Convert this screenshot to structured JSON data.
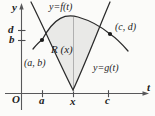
{
  "figure": {
    "background_color": "#fbfbf9",
    "ink_color": "#1d1d1d",
    "shade_color": "#e8e8e8"
  },
  "axes": {
    "y_axis_label": "y",
    "x_axis_label": "t",
    "origin_label": "O",
    "y_ticks": [
      {
        "label": "d",
        "value_px_y": 30
      },
      {
        "label": "b",
        "value_px_y": 40
      }
    ],
    "x_ticks": [
      {
        "label": "a",
        "value_px_x": 42
      },
      {
        "label": "x",
        "value_px_x": 73
      },
      {
        "label": "c",
        "value_px_x": 108
      }
    ]
  },
  "curves": [
    {
      "name": "f",
      "label": "y=f(t)",
      "shape": "concave-down arch (upper boundary)"
    },
    {
      "name": "g",
      "label": "y=g(t)",
      "shape": "concave-up parabola (lower boundary)"
    }
  ],
  "region": {
    "label": "R (x)",
    "description": "shaded area between f above and g below, from t=a to t=x"
  },
  "points": [
    {
      "label": "(a, b)",
      "px": [
        42,
        40
      ],
      "description": "left intersection of f and g"
    },
    {
      "label": "(c, d)",
      "px": [
        110,
        34
      ],
      "description": "right intersection of f and g"
    }
  ]
}
